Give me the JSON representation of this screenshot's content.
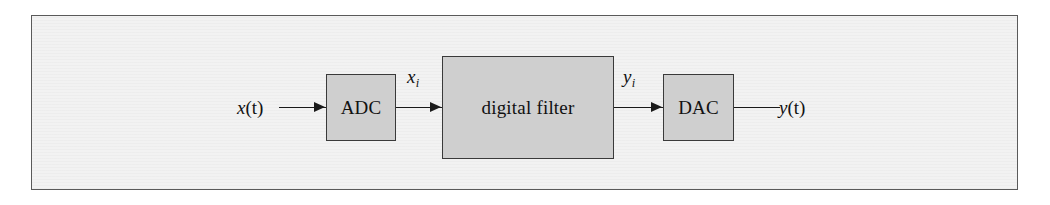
{
  "figure": {
    "kind": "block-diagram",
    "canvas": {
      "width": 1050,
      "height": 205
    },
    "frame": {
      "border_color": "#5a5a5a",
      "background_color": "#f2f2f2"
    }
  },
  "colors": {
    "block_fill": "#cfcfcf",
    "block_border": "#3a3a3a",
    "wire": "#1a1a1a",
    "text": "#111111",
    "plate_background": "#f2f2f2",
    "page_background": "#ffffff"
  },
  "blocks": [
    {
      "id": "adc",
      "label": "ADC",
      "name": "analog-to-digital-converter"
    },
    {
      "id": "filter",
      "label": "digital filter",
      "name": "digital-filter"
    },
    {
      "id": "dac",
      "label": "DAC",
      "name": "digital-to-analog-converter"
    }
  ],
  "signals": [
    {
      "id": "input",
      "base": "x",
      "arg": "(t)",
      "subscript": "",
      "full": "x(t)",
      "role": "analog input signal"
    },
    {
      "id": "sampled",
      "base": "x",
      "arg": "",
      "subscript": "i",
      "full": "x_i",
      "role": "sampled digital input sequence"
    },
    {
      "id": "filtered",
      "base": "y",
      "arg": "",
      "subscript": "i",
      "full": "y_i",
      "role": "filtered digital output sequence"
    },
    {
      "id": "output",
      "base": "y",
      "arg": "(t)",
      "subscript": "",
      "full": "y(t)",
      "role": "analog output signal"
    }
  ],
  "connectors": [
    {
      "id": "input-to-adc",
      "from": "x(t)",
      "to": "ADC",
      "arrowhead": true
    },
    {
      "id": "adc-to-filter",
      "from": "ADC",
      "to": "digital filter",
      "arrowhead": true
    },
    {
      "id": "filter-to-dac",
      "from": "digital filter",
      "to": "DAC",
      "arrowhead": true
    },
    {
      "id": "dac-to-output",
      "from": "DAC",
      "to": "y(t)",
      "arrowhead": false
    }
  ]
}
